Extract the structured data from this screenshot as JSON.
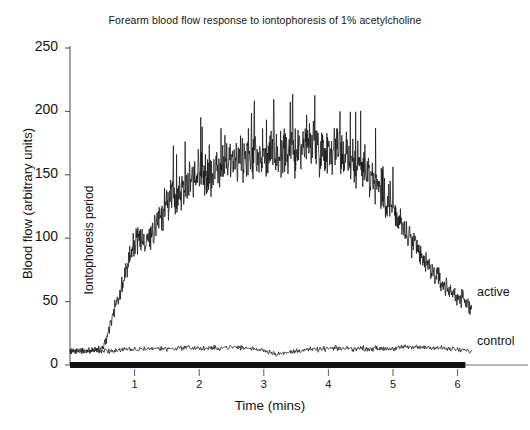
{
  "chart_data": {
    "type": "line",
    "title": "Forearm blood flow response to iontophoresis of 1% acetylcholine",
    "xlabel": "Time (mins)",
    "ylabel": "Blood flow (arbitrary units)",
    "xlim": [
      0,
      7.1
    ],
    "ylim": [
      0,
      250
    ],
    "grid": false,
    "legend_position": "right-inline",
    "yticks": [
      0,
      50,
      100,
      150,
      200,
      250
    ],
    "ytick_labels": [
      "0",
      "50",
      "100",
      "150",
      "200",
      "250"
    ],
    "xticks": [
      1,
      2,
      3,
      4,
      5,
      6
    ],
    "xtick_labels": [
      "1",
      "2",
      "3",
      "4",
      "5",
      "6"
    ],
    "annotations": [
      {
        "name": "iontophoresis-period",
        "text": "Iontophoresis period",
        "orientation": "vertical",
        "x": 0.28
      },
      {
        "name": "iontophoresis-bar",
        "text": "",
        "type": "bar",
        "x_start": 0.0,
        "x_end": 6.12,
        "y": 0
      }
    ],
    "series": [
      {
        "name": "active",
        "label": "active",
        "color": "#111111",
        "noise_amplitude": 22,
        "x": [
          0.0,
          0.1,
          0.2,
          0.3,
          0.4,
          0.5,
          0.55,
          0.6,
          0.7,
          0.8,
          0.9,
          1.0,
          1.05,
          1.1,
          1.2,
          1.3,
          1.4,
          1.5,
          1.6,
          1.7,
          1.8,
          1.9,
          2.0,
          2.1,
          2.2,
          2.3,
          2.4,
          2.5,
          2.6,
          2.7,
          2.8,
          2.9,
          3.0,
          3.1,
          3.2,
          3.3,
          3.4,
          3.5,
          3.6,
          3.7,
          3.8,
          3.9,
          4.0,
          4.1,
          4.2,
          4.3,
          4.4,
          4.5,
          4.6,
          4.7,
          4.8,
          4.9,
          5.0,
          5.1,
          5.2,
          5.3,
          5.4,
          5.5,
          5.6,
          5.7,
          5.8,
          5.9,
          6.0,
          6.1,
          6.2
        ],
        "y": [
          11,
          11,
          11,
          11,
          12,
          13,
          18,
          28,
          45,
          62,
          80,
          96,
          104,
          95,
          98,
          108,
          118,
          126,
          133,
          138,
          142,
          148,
          152,
          152,
          150,
          155,
          158,
          160,
          162,
          164,
          165,
          166,
          167,
          165,
          164,
          166,
          168,
          170,
          172,
          174,
          173,
          171,
          170,
          172,
          168,
          164,
          160,
          156,
          152,
          146,
          138,
          130,
          122,
          112,
          104,
          96,
          88,
          80,
          74,
          68,
          62,
          58,
          54,
          50,
          46
        ],
        "peak_spike_max": 218,
        "end_value": 46
      },
      {
        "name": "control",
        "label": "control",
        "color": "#222222",
        "noise_amplitude": 2.5,
        "x": [
          0.0,
          0.2,
          0.4,
          0.6,
          0.8,
          1.0,
          1.2,
          1.4,
          1.6,
          1.8,
          2.0,
          2.2,
          2.4,
          2.6,
          2.8,
          3.0,
          3.1,
          3.2,
          3.3,
          3.4,
          3.6,
          3.8,
          4.0,
          4.2,
          4.4,
          4.6,
          4.8,
          5.0,
          5.2,
          5.4,
          5.6,
          5.8,
          6.0,
          6.2
        ],
        "y": [
          11,
          11,
          11,
          11,
          12,
          12,
          13,
          13,
          13,
          14,
          13,
          13,
          14,
          14,
          13,
          12,
          10,
          9,
          9,
          10,
          12,
          12,
          13,
          13,
          13,
          13,
          13,
          13,
          14,
          14,
          14,
          13,
          12,
          11
        ]
      }
    ]
  }
}
